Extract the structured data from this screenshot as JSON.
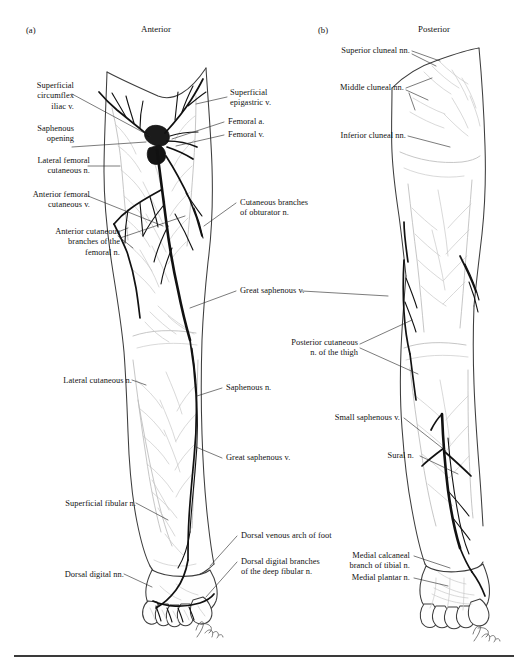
{
  "figure": {
    "panels": [
      {
        "tag": "(a)",
        "title": "Anterior"
      },
      {
        "tag": "(b)",
        "title": "Posterior"
      }
    ],
    "caption": "",
    "artist_signature": "Schwartz",
    "colors": {
      "ink": "#111111",
      "outline": "#3d3d3d",
      "faint_vessel": "#b9b9b9",
      "bold_vessel": "#111111",
      "leader": "#2a2a2a",
      "rule": "#3a3a3a"
    }
  },
  "labels_anterior_left": [
    {
      "id": "superficial-circumflex-iliac-v",
      "text": "Superficial\ncircumflex\niliac v."
    },
    {
      "id": "saphenous-opening",
      "text": "Saphenous\nopening"
    },
    {
      "id": "lateral-femoral-cutaneous-n",
      "text": "Lateral femoral\ncutaneous n."
    },
    {
      "id": "anterior-femoral-cutaneous-v",
      "text": "Anterior femoral\ncutaneous v."
    },
    {
      "id": "anterior-cutaneous-branches-femoral-n",
      "text": "Anterior cutaneous\nbranches of the\nfemoral n."
    },
    {
      "id": "lateral-cutaneous-n",
      "text": "Lateral cutaneous n."
    },
    {
      "id": "superficial-fibular-n",
      "text": "Superficial fibular n."
    },
    {
      "id": "dorsal-digital-nn",
      "text": "Dorsal digital nn."
    }
  ],
  "labels_anterior_right": [
    {
      "id": "superficial-epigastric-v",
      "text": "Superficial\nepigastric v."
    },
    {
      "id": "femoral-a",
      "text": "Femoral a."
    },
    {
      "id": "femoral-v",
      "text": "Femoral v."
    },
    {
      "id": "cutaneous-branches-obturator-n",
      "text": "Cutaneous branches\nof obturator n."
    },
    {
      "id": "great-saphenous-v-mid",
      "text": "Great saphenous v."
    },
    {
      "id": "saphenous-n",
      "text": "Saphenous n."
    },
    {
      "id": "great-saphenous-v-leg",
      "text": "Great saphenous v."
    },
    {
      "id": "dorsal-venous-arch-of-foot",
      "text": "Dorsal venous arch of foot"
    },
    {
      "id": "dorsal-digital-branches-deep-fibular-n",
      "text": "Dorsal digital branches\nof the deep fibular n."
    }
  ],
  "labels_posterior_left": [
    {
      "id": "superior-cluneal-nn",
      "text": "Superior cluneal nn."
    },
    {
      "id": "middle-cluneal-nn",
      "text": "Middle cluneal nn."
    },
    {
      "id": "inferior-cluneal-nn",
      "text": "Inferior cluneal nn."
    },
    {
      "id": "posterior-cutaneous-n-of-thigh",
      "text": "Posterior cutaneous\nn. of the thigh"
    },
    {
      "id": "small-saphenous-v",
      "text": "Small saphenous v."
    },
    {
      "id": "sural-n",
      "text": "Sural n."
    },
    {
      "id": "medial-calcaneal-branch-of-tibial-n",
      "text": "Medial calcaneal\nbranch of tibial n."
    },
    {
      "id": "medial-plantar-n",
      "text": "Medial plantar n."
    }
  ]
}
